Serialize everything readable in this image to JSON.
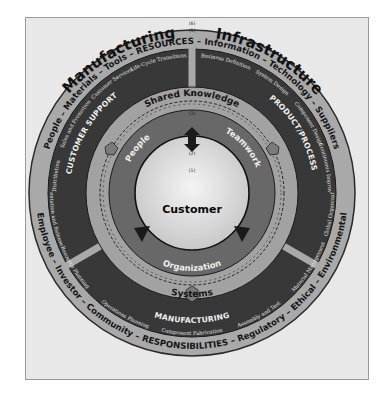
{
  "diagram": {
    "title_left": "Manufacturing",
    "title_right": "Infrastructure",
    "level_labels": {
      "l1": "(1)",
      "l2": "(2)",
      "l3": "(3)",
      "l4": "(4)",
      "l5": "(5)",
      "l6": "(6)"
    },
    "resources_ring": "People – Materials – Tools – RESOURCES – Information – Technology – Suppliers",
    "responsibilities_ring": "Employee – Investor – Community – RESPONSIBILITIES – Regulatory – Ethical – Environmental",
    "sectors": {
      "customer_support": {
        "title": "CUSTOMER SUPPORT",
        "items": [
          "Global Organization",
          "Distribution",
          "Sales and Promotion",
          "Customer Services",
          "Life-Cycle Transitions"
        ]
      },
      "product_process": {
        "title": "PRODUCT/PROCESS",
        "items": [
          "Business Definition",
          "System Design",
          "Component Design",
          "Continuous Improvement",
          "Documentation and Release"
        ]
      },
      "manufacturing": {
        "title": "MANUFACTURING",
        "items": [
          "Material Management",
          "Assembly and Test",
          "Component Fabrication",
          "Operations Planning",
          "Resource Planning"
        ]
      }
    },
    "inner_ring": {
      "top": "Shared Knowledge",
      "bottom": "Systems"
    },
    "middle_ring": {
      "left": "People",
      "right": "Teamwork",
      "bottom": "Organization"
    },
    "center": "Customer"
  },
  "colors": {
    "background": "#e8e8e8",
    "outer_ring": "#a9a9a9",
    "sector_dark": "#383838",
    "inner_ring": "#a2a2a2",
    "middle_ring": "#686868",
    "center": "#dedede"
  }
}
